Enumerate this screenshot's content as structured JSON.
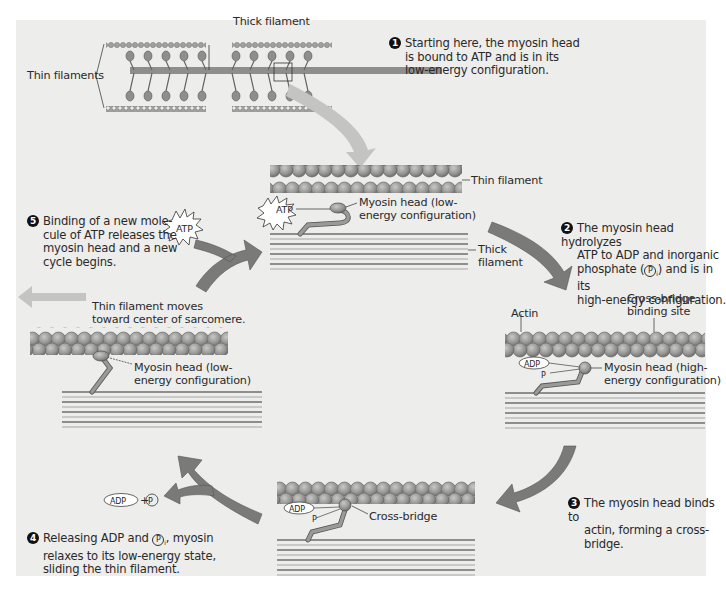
{
  "overview": {
    "thick_filament_label": "Thick filament",
    "thin_filaments_label": "Thin filaments"
  },
  "steps": [
    {
      "number": "1",
      "text": [
        "Starting here, the myosin head",
        "is bound to ATP and is in its",
        "low-energy configuration."
      ]
    },
    {
      "number": "2",
      "text": [
        "The myosin head hydrolyzes",
        "ATP to ADP and inorganic",
        "phosphate (",
        ") and is in its",
        "high-energy configuration."
      ]
    },
    {
      "number": "3",
      "text": [
        "The myosin head binds to",
        "actin, forming a cross-",
        "bridge."
      ]
    },
    {
      "number": "4",
      "text": [
        "Releasing ADP and ",
        ", myosin",
        "relaxes to its low-energy state,",
        "sliding the thin filament."
      ]
    },
    {
      "number": "5",
      "text": [
        "Binding of a new mole-",
        "cule of ATP releases the",
        "myosin head and a new",
        "cycle begins."
      ]
    }
  ],
  "labels": {
    "thin_filament": "Thin filament",
    "thick_filament_1": "Thick",
    "thick_filament_2": "filament",
    "myosin_low_1": "Myosin head (low-",
    "myosin_low_2": "energy configuration)",
    "myosin_high_1": "Myosin head (high-",
    "myosin_high_2": "energy configuration)",
    "actin": "Actin",
    "cross_bridge_site_1": "Cross-bridge",
    "cross_bridge_site_2": "binding site",
    "cross_bridge": "Cross-bridge",
    "movement_1": "Thin filament moves",
    "movement_2": "toward center of sarcomere.",
    "atp": "ATP",
    "adp": "ADP",
    "pi": "P",
    "pi_sub": "i",
    "plus": "+"
  },
  "colors": {
    "panel_bg": "#ededeb",
    "actin_bead": "#9a9a98",
    "actin_edge": "#6a6a68",
    "arrow": "#7a7a78",
    "big_arrow_light": "#c4c4c2",
    "thick_line_dark": "#6e6e6c",
    "thick_line_light": "#bdbdbb"
  }
}
